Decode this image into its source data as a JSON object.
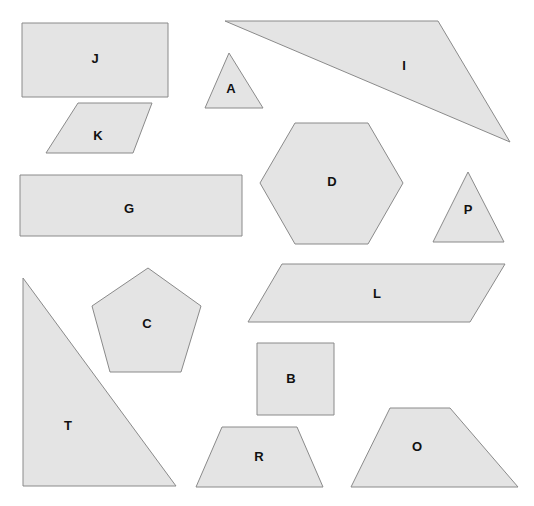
{
  "canvas": {
    "width": 534,
    "height": 506,
    "background": "#ffffff",
    "shape_fill": "#e4e4e4",
    "shape_stroke": "#8a8a8a",
    "label_color": "#111111"
  },
  "diagram": {
    "shape_count": 13,
    "shapes": [
      {
        "id": "shape-j",
        "label": "J",
        "kind": "rectangle",
        "points": "22,23 168,23 168,97 22,97",
        "label_x": 95,
        "label_y": 60
      },
      {
        "id": "shape-a",
        "label": "A",
        "kind": "triangle",
        "points": "229,53 263,108 205,108",
        "label_x": 231,
        "label_y": 90
      },
      {
        "id": "shape-i",
        "label": "I",
        "kind": "triangle",
        "points": "225,21 438,21 510,142",
        "label_x": 404,
        "label_y": 67
      },
      {
        "id": "shape-k",
        "label": "K",
        "kind": "parallelogram",
        "points": "78,103 152,103 133,153 46,153",
        "label_x": 98,
        "label_y": 137
      },
      {
        "id": "shape-d",
        "label": "D",
        "kind": "hexagon",
        "points": "295,123 368,123 403,183 368,244 295,244 260,183",
        "label_x": 332,
        "label_y": 183
      },
      {
        "id": "shape-g",
        "label": "G",
        "kind": "rectangle",
        "points": "20,175 242,175 242,236 20,236",
        "label_x": 129,
        "label_y": 210
      },
      {
        "id": "shape-p",
        "label": "P",
        "kind": "triangle",
        "points": "468,172 504,242 433,242",
        "label_x": 468,
        "label_y": 211
      },
      {
        "id": "shape-l",
        "label": "L",
        "kind": "parallelogram",
        "points": "282,264 505,264 470,322 248,322",
        "label_x": 377,
        "label_y": 295
      },
      {
        "id": "shape-c",
        "label": "C",
        "kind": "pentagon",
        "points": "148,268 201,306 181,372 110,372 92,306",
        "label_x": 147,
        "label_y": 325
      },
      {
        "id": "shape-b",
        "label": "B",
        "kind": "square",
        "points": "257,343 334,343 334,415 257,415",
        "label_x": 291,
        "label_y": 380
      },
      {
        "id": "shape-t",
        "label": "T",
        "kind": "right-triangle",
        "points": "23,278 176,486 23,486",
        "label_x": 68,
        "label_y": 427
      },
      {
        "id": "shape-r",
        "label": "R",
        "kind": "trapezoid",
        "points": "222,427 297,427 323,487 196,487",
        "label_x": 259,
        "label_y": 458
      },
      {
        "id": "shape-o",
        "label": "O",
        "kind": "trapezoid",
        "points": "390,408 450,408 518,487 351,487",
        "label_x": 417,
        "label_y": 448
      }
    ]
  }
}
